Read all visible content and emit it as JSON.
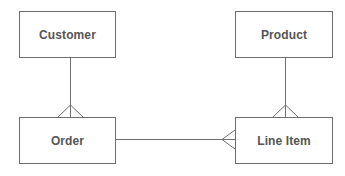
{
  "diagram": {
    "type": "entity-relationship",
    "notation": "crow's foot",
    "colors": {
      "stroke": "#6e6e6e",
      "text": "#555555",
      "background": "#ffffff"
    },
    "entities": [
      {
        "id": "customer",
        "label": "Customer"
      },
      {
        "id": "order",
        "label": "Order"
      },
      {
        "id": "product",
        "label": "Product"
      },
      {
        "id": "line_item",
        "label": "Line Item"
      }
    ],
    "relationships": [
      {
        "from": "Customer",
        "to": "Order",
        "from_cardinality": "one",
        "to_cardinality": "many"
      },
      {
        "from": "Order",
        "to": "Line Item",
        "from_cardinality": "one",
        "to_cardinality": "many"
      },
      {
        "from": "Product",
        "to": "Line Item",
        "from_cardinality": "one",
        "to_cardinality": "many"
      }
    ]
  }
}
